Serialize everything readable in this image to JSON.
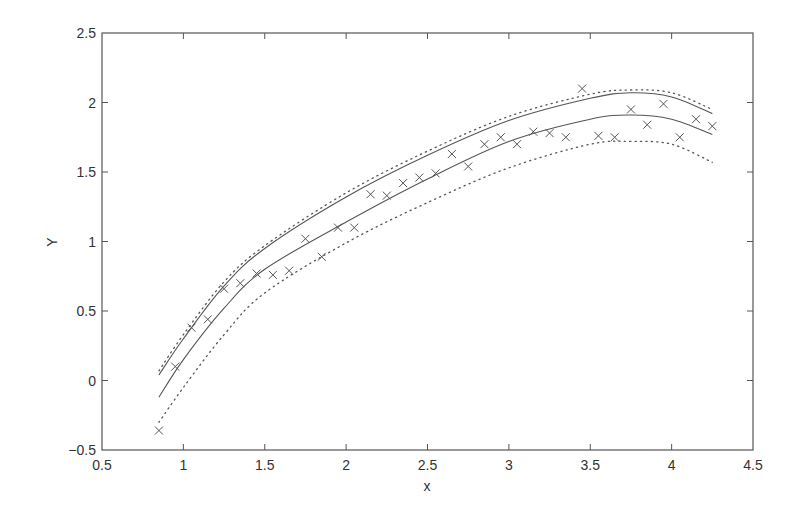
{
  "chart_data": {
    "type": "scatter",
    "title": "",
    "xlabel": "x",
    "ylabel": "Y",
    "xlim": [
      0.5,
      4.5
    ],
    "ylim": [
      -0.5,
      2.5
    ],
    "grid": false,
    "legend": null,
    "xticks": [
      0.5,
      1,
      1.5,
      2,
      2.5,
      3,
      3.5,
      4,
      4.5
    ],
    "xtick_labels": [
      "0.5",
      "1",
      "1.5",
      "2",
      "2.5",
      "3",
      "3.5",
      "4",
      "4.5"
    ],
    "yticks": [
      -0.5,
      0,
      0.5,
      1,
      1.5,
      2,
      2.5
    ],
    "ytick_labels": [
      "-0.5",
      "0",
      "0.5",
      "1",
      "1.5",
      "2",
      "2.5"
    ],
    "colors": {
      "axis": "#555555",
      "series": "#555555",
      "text": "#333333"
    },
    "series": [
      {
        "name": "observations",
        "style": "marker-x",
        "x": [
          0.85,
          0.95,
          1.05,
          1.15,
          1.25,
          1.35,
          1.45,
          1.55,
          1.65,
          1.75,
          1.85,
          1.95,
          2.05,
          2.15,
          2.25,
          2.35,
          2.45,
          2.55,
          2.65,
          2.75,
          2.85,
          2.95,
          3.05,
          3.15,
          3.25,
          3.35,
          3.45,
          3.55,
          3.65,
          3.75,
          3.85,
          3.95,
          4.05,
          4.15,
          4.25
        ],
        "y": [
          -0.36,
          0.1,
          0.38,
          0.44,
          0.66,
          0.7,
          0.77,
          0.76,
          0.79,
          1.02,
          0.89,
          1.1,
          1.1,
          1.34,
          1.33,
          1.42,
          1.46,
          1.49,
          1.63,
          1.54,
          1.7,
          1.75,
          1.7,
          1.79,
          1.78,
          1.75,
          2.1,
          1.76,
          1.75,
          1.95,
          1.84,
          1.99,
          1.75,
          1.88,
          1.83
        ]
      },
      {
        "name": "upper-solid-curve",
        "style": "solid",
        "x": [
          0.85,
          1.0,
          1.25,
          1.5,
          2.0,
          2.5,
          3.0,
          3.5,
          3.75,
          4.0,
          4.25
        ],
        "y": [
          0.04,
          0.3,
          0.68,
          0.95,
          1.32,
          1.62,
          1.87,
          2.03,
          2.07,
          2.04,
          1.92
        ]
      },
      {
        "name": "upper-dotted-curve",
        "style": "dotted",
        "x": [
          0.85,
          1.0,
          1.25,
          1.5,
          2.0,
          2.5,
          3.0,
          3.5,
          3.75,
          4.0,
          4.25
        ],
        "y": [
          0.07,
          0.33,
          0.71,
          0.97,
          1.35,
          1.65,
          1.9,
          2.06,
          2.09,
          2.07,
          1.95
        ]
      },
      {
        "name": "lower-solid-curve",
        "style": "solid",
        "x": [
          0.85,
          1.0,
          1.25,
          1.5,
          2.0,
          2.5,
          3.0,
          3.5,
          3.75,
          4.0,
          4.25
        ],
        "y": [
          -0.12,
          0.15,
          0.52,
          0.8,
          1.14,
          1.45,
          1.72,
          1.88,
          1.91,
          1.88,
          1.77
        ]
      },
      {
        "name": "lower-dotted-curve",
        "style": "dotted",
        "x": [
          0.85,
          1.0,
          1.25,
          1.5,
          2.0,
          2.5,
          3.0,
          3.5,
          3.75,
          4.0,
          4.25
        ],
        "y": [
          -0.3,
          -0.05,
          0.33,
          0.63,
          0.99,
          1.28,
          1.53,
          1.7,
          1.72,
          1.7,
          1.57
        ]
      }
    ]
  }
}
